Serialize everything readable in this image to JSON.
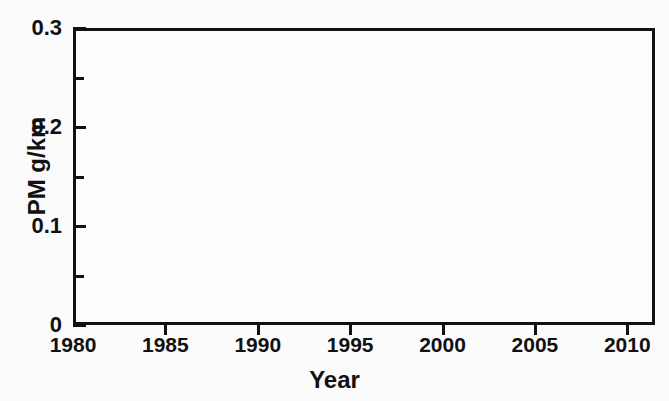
{
  "chart_data": {
    "type": "bar",
    "title": "",
    "subtitle": "",
    "xlabel": "Year",
    "ylabel": "PM g/km",
    "xlim": [
      1980,
      2011.5
    ],
    "ylim": [
      0,
      0.3
    ],
    "xtick_labels": [
      "1980",
      "1985",
      "1990",
      "1995",
      "2000",
      "2005",
      "2010"
    ],
    "xticks": [
      1980,
      1985,
      1990,
      1995,
      2000,
      2005,
      2010
    ],
    "ytick_labels": [
      "0",
      "0.1",
      "0.2",
      "0.3"
    ],
    "yticks": [
      0,
      0.1,
      0.2,
      0.3
    ],
    "yticks_minor": [
      0.05,
      0.15,
      0.25
    ],
    "grid": false,
    "legend": false,
    "legend_position": "none",
    "bar_color": "#0d0d0d",
    "axis_color": "#111111",
    "background_color": "#fdfdfd",
    "categories": [
      1983,
      1993,
      1997,
      2000,
      2005,
      2009
    ],
    "values": [
      0.274,
      0.146,
      0.083,
      0.055,
      0.033,
      0.009
    ],
    "bars": [
      {
        "x": 1983,
        "value": 0.274,
        "label": "1983"
      },
      {
        "x": 1993,
        "value": 0.146,
        "label": "1993"
      },
      {
        "x": 1997,
        "value": 0.083,
        "label": "1997"
      },
      {
        "x": 2000,
        "value": 0.055,
        "label": "2000"
      },
      {
        "x": 2005,
        "value": 0.033,
        "label": "2005"
      },
      {
        "x": 2009,
        "value": 0.009,
        "label": "2009"
      }
    ]
  }
}
